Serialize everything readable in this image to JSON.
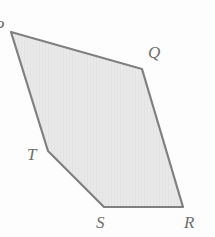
{
  "figure": {
    "name": "pentagon-PQRST",
    "shape_type": "pentagon",
    "background_color": "#fdfdfd",
    "fill_color": "#e7e7e7",
    "stroke_color": "#808080",
    "stroke_width": 2.2,
    "label_color": "#6e6e6e",
    "texture": "faint-vertical-hatch",
    "vertices": [
      {
        "id": "P",
        "label": "P",
        "x": 11,
        "y": 32,
        "clipped": true
      },
      {
        "id": "Q",
        "label": "Q",
        "x": 142,
        "y": 69,
        "clipped": false
      },
      {
        "id": "R",
        "label": "R",
        "x": 183,
        "y": 207,
        "clipped": false
      },
      {
        "id": "S",
        "label": "S",
        "x": 104,
        "y": 207,
        "clipped": false
      },
      {
        "id": "T",
        "label": "T",
        "x": 48,
        "y": 151,
        "clipped": false
      }
    ],
    "edges": [
      {
        "from": "P",
        "to": "Q"
      },
      {
        "from": "Q",
        "to": "R"
      },
      {
        "from": "R",
        "to": "S"
      },
      {
        "from": "S",
        "to": "T"
      },
      {
        "from": "T",
        "to": "P"
      }
    ],
    "path": "M 11,32 L 142,69 L 183,207 L 104,207 L 48,151 Z"
  }
}
